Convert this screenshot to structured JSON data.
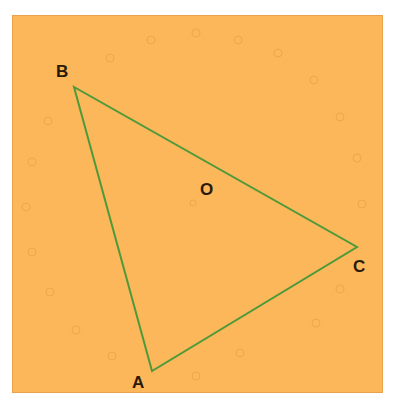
{
  "diagram": {
    "type": "triangle",
    "background_color": "#fbb75a",
    "line_color": "#4e9a3a",
    "vertices": [
      {
        "name": "A",
        "x": 152,
        "y": 371
      },
      {
        "name": "B",
        "x": 74,
        "y": 87
      },
      {
        "name": "C",
        "x": 357,
        "y": 247
      }
    ],
    "points": [
      {
        "name": "O",
        "x": 207,
        "y": 191
      }
    ],
    "labels": {
      "A": "A",
      "B": "B",
      "C": "C",
      "O": "O"
    }
  }
}
